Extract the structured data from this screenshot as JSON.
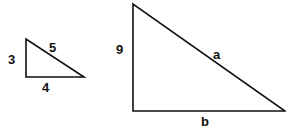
{
  "small_triangle": {
    "vertical_side": "3",
    "horizontal_side": "4",
    "hypotenuse": "5"
  },
  "large_triangle": {
    "vertical_side": "9",
    "horizontal_side": "b",
    "hypotenuse": "a"
  },
  "colors": {
    "stroke": "#111111",
    "background": "#ffffff"
  }
}
